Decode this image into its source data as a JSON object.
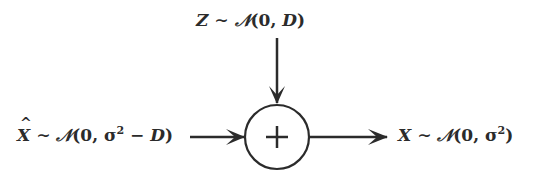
{
  "diagram": {
    "type": "additive-noise-channel",
    "nodes": {
      "noise": {
        "variable": "Z",
        "relation": "∼",
        "distribution": "𝒩",
        "args_open": "(0, ",
        "param": "D",
        "args_close": ")"
      },
      "input": {
        "variable": "X",
        "hat": true,
        "relation": "∼",
        "distribution": "𝒩",
        "args_open": "(0, σ",
        "exponent": "2",
        "mid": " − ",
        "param": "D",
        "args_close": ")"
      },
      "adder": {
        "symbol": "+"
      },
      "output": {
        "variable": "X",
        "relation": "∼",
        "distribution": "𝒩",
        "args_open": "(0, σ",
        "exponent": "2",
        "args_close": ")"
      }
    },
    "edges": [
      {
        "from": "noise",
        "to": "adder"
      },
      {
        "from": "input",
        "to": "adder"
      },
      {
        "from": "adder",
        "to": "output"
      }
    ],
    "colors": {
      "stroke": "#2b2b2b",
      "background": "#ffffff"
    }
  }
}
